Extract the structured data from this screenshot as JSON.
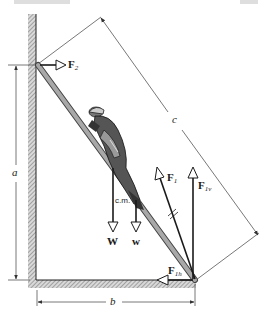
{
  "figure": {
    "labels": {
      "F2": {
        "main": "F",
        "sub": "2"
      },
      "F1": {
        "main": "F",
        "sub": "1"
      },
      "F1v": {
        "main": "F",
        "sub": "1v"
      },
      "F1h": {
        "main": "F",
        "sub": "1h"
      },
      "W": "W",
      "w": "w",
      "cm": "c.m.",
      "a": "a",
      "b": "b",
      "c": "c"
    },
    "colors": {
      "line": "#1a1a1a",
      "hatch": "#8a8a8a",
      "ladder": "#9a9a9a",
      "dimension": "#555555"
    }
  }
}
